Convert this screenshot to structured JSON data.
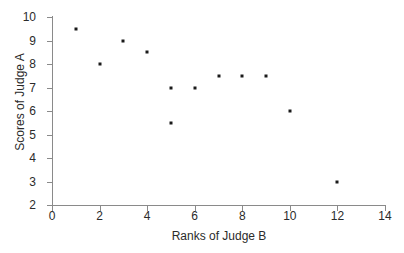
{
  "chart_data": {
    "type": "scatter",
    "title": "",
    "xlabel": "Ranks of Judge B",
    "ylabel": "Scores of Judge A",
    "xlim": [
      0,
      14
    ],
    "ylim": [
      2,
      10
    ],
    "xticks": [
      0,
      2,
      4,
      6,
      8,
      10,
      12,
      14
    ],
    "yticks": [
      2,
      3,
      4,
      5,
      6,
      7,
      8,
      9,
      10
    ],
    "grid": false,
    "legend": null,
    "marker": "square",
    "marker_color": "#1a1a1a",
    "axis_color": "#8a8a8a",
    "background": "#ffffff",
    "points": [
      {
        "x": 1,
        "y": 9.5
      },
      {
        "x": 2,
        "y": 8
      },
      {
        "x": 3,
        "y": 9
      },
      {
        "x": 4,
        "y": 8.5
      },
      {
        "x": 5,
        "y": 7
      },
      {
        "x": 5,
        "y": 5.5
      },
      {
        "x": 6,
        "y": 7
      },
      {
        "x": 7,
        "y": 7.5
      },
      {
        "x": 8,
        "y": 7.5
      },
      {
        "x": 9,
        "y": 7.5
      },
      {
        "x": 10,
        "y": 6
      },
      {
        "x": 12,
        "y": 3
      }
    ]
  }
}
